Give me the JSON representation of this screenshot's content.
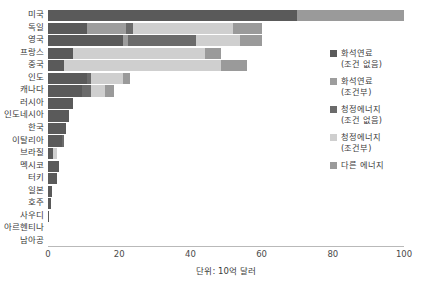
{
  "chart_data": {
    "type": "bar",
    "orientation": "horizontal",
    "stacked": true,
    "title": "",
    "subtitle": "",
    "xlabel": "단위: 10억 달러",
    "ylabel": "",
    "xlim": [
      0,
      100
    ],
    "xticks": [
      0,
      20,
      40,
      60,
      80,
      100
    ],
    "grid": false,
    "legend_position": "right",
    "categories": [
      "미국",
      "독일",
      "영국",
      "프랑스",
      "중국",
      "인도",
      "캐나다",
      "러시아",
      "인도네시아",
      "한국",
      "이탈리아",
      "브라질",
      "멕시코",
      "터키",
      "일본",
      "호주",
      "사우디",
      "아르헨티나",
      "남아공"
    ],
    "series": [
      {
        "name": "화석연료\n(조건 없음)",
        "color": "#5a5a5a",
        "values": [
          70.0,
          11.0,
          21.0,
          7.0,
          4.5,
          11.0,
          9.5,
          7.0,
          6.0,
          5.0,
          4.0,
          1.4,
          3.0,
          2.6,
          1.2,
          0.9,
          0.3,
          0.0,
          0.0
        ]
      },
      {
        "name": "화석연료\n(조건부)",
        "color": "#9d9d9d",
        "values": [
          0.0,
          11.0,
          1.5,
          0.0,
          0.0,
          0.0,
          0.0,
          0.0,
          0.0,
          0.0,
          0.0,
          0.0,
          0.0,
          0.0,
          0.0,
          0.0,
          0.0,
          0.0,
          0.0
        ]
      },
      {
        "name": "청정에너지\n(조건 없음)",
        "color": "#6b6b6b",
        "values": [
          0.0,
          2.0,
          19.0,
          0.0,
          0.0,
          1.0,
          2.5,
          0.0,
          0.0,
          0.0,
          0.6,
          0.0,
          0.0,
          0.0,
          0.0,
          0.0,
          0.0,
          0.0,
          0.0
        ]
      },
      {
        "name": "청정에너지\n(조건부)",
        "color": "#cfcfcf",
        "values": [
          0.0,
          28.0,
          12.5,
          37.0,
          44.0,
          9.0,
          4.0,
          0.0,
          0.0,
          0.0,
          0.0,
          1.0,
          0.0,
          0.0,
          0.0,
          0.0,
          0.0,
          0.0,
          0.0
        ]
      },
      {
        "name": "다른 에너지",
        "color": "#9a9a9a",
        "values": [
          30.0,
          8.0,
          6.0,
          4.5,
          7.5,
          2.0,
          2.5,
          0.0,
          0.0,
          0.0,
          0.0,
          0.0,
          0.0,
          0.0,
          0.0,
          0.0,
          0.0,
          0.0,
          0.0
        ]
      }
    ]
  },
  "axis": {
    "tick_labels": [
      "0",
      "20",
      "40",
      "60",
      "80",
      "100"
    ],
    "caption": "단위: 10억 달러"
  }
}
